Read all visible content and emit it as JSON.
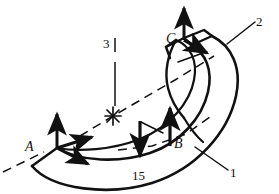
{
  "figure": {
    "type": "engineering-line-diagram",
    "background_color": "#ffffff",
    "line_color": "#111111",
    "canvas": {
      "width": 279,
      "height": 194
    }
  },
  "labels": {
    "point_a": "A",
    "point_b": "B",
    "point_c": "C",
    "axis_1": "1",
    "axis_2": "2",
    "axis_3": "3",
    "load_value": "15"
  },
  "frames": [
    {
      "name": "frame-a",
      "label": "A",
      "origin": [
        57,
        148
      ],
      "label_position": [
        28,
        146
      ],
      "arrows": [
        {
          "name": "a-axis-vertical",
          "direction": "up",
          "tip": [
            57,
            110
          ]
        },
        {
          "name": "a-axis-upper-right",
          "direction": "up-right",
          "tip": [
            96,
            136
          ]
        },
        {
          "name": "a-axis-lower-right",
          "direction": "down-right",
          "tip": [
            92,
            166
          ]
        }
      ]
    },
    {
      "name": "frame-b",
      "label": "B",
      "origin": [
        170,
        144
      ],
      "label_position": [
        175,
        142
      ],
      "arrows": [
        {
          "name": "b-axis-vertical",
          "direction": "up",
          "tip": [
            170,
            104
          ]
        }
      ]
    },
    {
      "name": "frame-c",
      "label": "C",
      "origin": [
        184,
        38
      ],
      "label_position": [
        169,
        38
      ],
      "arrows": [
        {
          "name": "c-axis-vertical",
          "direction": "up",
          "tip": [
            184,
            4
          ]
        },
        {
          "name": "c-axis-lower-right",
          "direction": "down-right",
          "tip": [
            212,
            57
          ]
        }
      ]
    }
  ],
  "load": {
    "name": "applied-load",
    "label": "15",
    "direction": "down",
    "tail": [
      140,
      121
    ],
    "tip": [
      140,
      160
    ],
    "label_position": [
      133,
      176
    ]
  },
  "axes": [
    {
      "name": "axis-1",
      "label": "1",
      "style": "leader",
      "label_position": [
        232,
        172
      ]
    },
    {
      "name": "axis-2",
      "label": "2",
      "style": "leader",
      "label_position": [
        259,
        32
      ]
    },
    {
      "name": "axis-3",
      "label": "3",
      "style": "vertical-line",
      "label_position": [
        106,
        44
      ]
    }
  ],
  "center_mark": {
    "name": "center-asterisk",
    "position": [
      113,
      116
    ]
  }
}
